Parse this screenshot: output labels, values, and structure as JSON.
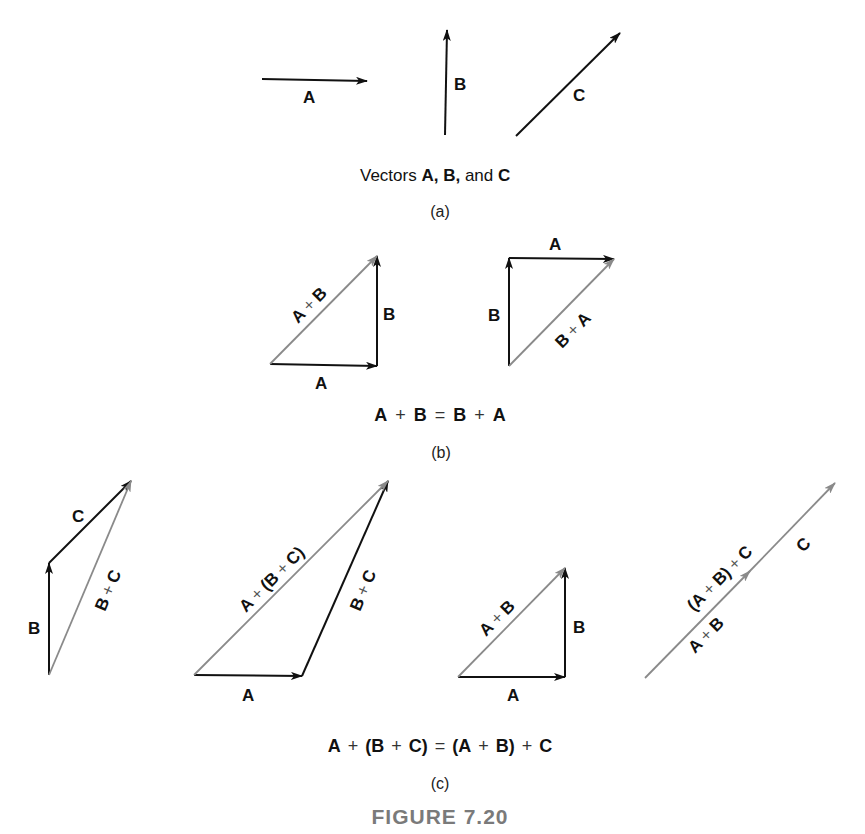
{
  "figure": {
    "title": "FIGURE 7.20",
    "colors": {
      "vector": "#111111",
      "resultant": "#8a8a8a",
      "title": "#7a7a7a"
    }
  },
  "part_a": {
    "label": "(a)",
    "caption": {
      "prefix": "Vectors ",
      "a": "A,",
      "sep1": " ",
      "b": "B,",
      "mid": " and ",
      "c": "C"
    },
    "vectors": [
      {
        "name": "A",
        "label": "A",
        "from": [
          262,
          79
        ],
        "to": [
          367,
          81
        ]
      },
      {
        "name": "B",
        "label": "B",
        "from": [
          445,
          135
        ],
        "to": [
          447,
          30
        ]
      },
      {
        "name": "C",
        "label": "C",
        "from": [
          516,
          136
        ],
        "to": [
          620,
          33
        ]
      }
    ]
  },
  "part_b": {
    "label": "(b)",
    "equation": {
      "t1": "A",
      "op1": "+",
      "t2": "B",
      "eq": "=",
      "t3": "B",
      "op2": "+",
      "t4": "A"
    },
    "left": {
      "a_label": "A",
      "b_label": "B",
      "sum_label": {
        "l": "A",
        "op": "+",
        "r": "B"
      }
    },
    "right": {
      "a_label": "A",
      "b_label": "B",
      "sum_label": {
        "l": "B",
        "op": "+",
        "r": "A"
      }
    }
  },
  "part_c": {
    "label": "(c)",
    "equation": {
      "t1": "A",
      "op1": "+",
      "p1": "(B",
      "op2": "+",
      "p2": "C)",
      "eq": "=",
      "p3": "(A",
      "op3": "+",
      "p4": "B)",
      "op4": "+",
      "t5": "C"
    },
    "d1": {
      "b_label": "B",
      "c_label": "C",
      "sum_label": {
        "l": "B",
        "op": "+",
        "r": "C"
      }
    },
    "d2": {
      "a_label": "A",
      "bc_label": {
        "l": "B",
        "op": "+",
        "r": "C"
      },
      "sum_label": {
        "l": "A",
        "op1": "+",
        "m": "(B",
        "op2": "+",
        "r": "C)"
      }
    },
    "d3": {
      "a_label": "A",
      "b_label": "B",
      "sum_label": {
        "l": "A",
        "op": "+",
        "r": "B"
      }
    },
    "d4": {
      "upper_label": {
        "l": "(A",
        "op1": "+",
        "m": "B)",
        "op2": "+",
        "r": "C"
      },
      "ab_label": {
        "l": "A",
        "op": "+",
        "r": "B"
      },
      "c_label": "C"
    }
  }
}
